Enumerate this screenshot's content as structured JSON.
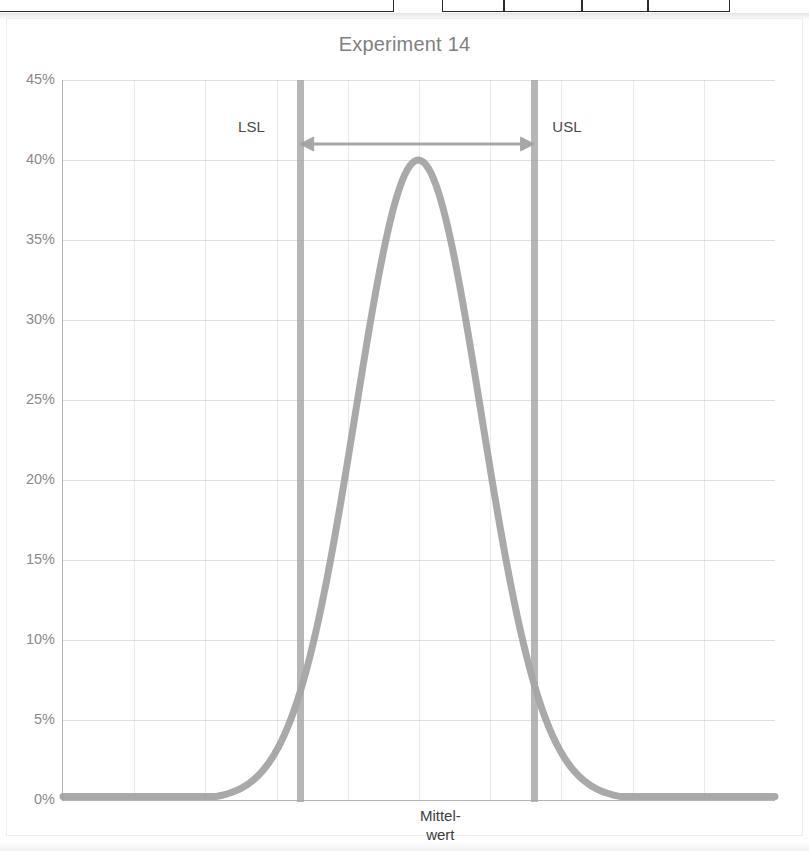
{
  "chart_title": "Experiment 14",
  "top_cut_cells": [
    {
      "left": -6,
      "width": 400
    },
    {
      "left": 442,
      "width": 62
    },
    {
      "left": 504,
      "width": 78
    },
    {
      "left": 582,
      "width": 66
    },
    {
      "left": 648,
      "width": 82
    }
  ],
  "axis": {
    "y_ticks": [
      "45%",
      "40%",
      "35%",
      "30%",
      "25%",
      "20%",
      "15%",
      "10%",
      "5%",
      "0%"
    ],
    "y_values": [
      45,
      40,
      35,
      30,
      25,
      20,
      15,
      10,
      5,
      0
    ],
    "y_min": 0,
    "y_max": 45
  },
  "annotations": {
    "lsl_label": "LSL",
    "usl_label": "USL",
    "mean_label_line1": "Mittel-",
    "mean_label_line2": "wert"
  },
  "colors": {
    "curve": "#9a9a9a",
    "spec_line": "#a6a6a6",
    "arrow": "#9e9e9e",
    "title_text": "#808080",
    "tick_text": "#8a8a8a",
    "annotation_text": "#3d3d3d",
    "gridline": "#c4c4c4",
    "background": "#ffffff"
  },
  "chart_data": {
    "type": "line",
    "title": "Experiment 14",
    "xlabel": "",
    "ylabel": "",
    "ylim": [
      0,
      45
    ],
    "grid": true,
    "legend": "none",
    "series": [
      {
        "name": "Normal distribution (Gauss curve)",
        "peak_value": 40,
        "peak_x_fraction": 0.499,
        "sigma_fraction": 0.088,
        "x": [
          0.0,
          0.05,
          0.1,
          0.15,
          0.2,
          0.25,
          0.3,
          0.33,
          0.36,
          0.39,
          0.42,
          0.45,
          0.47,
          0.5,
          0.53,
          0.55,
          0.58,
          0.61,
          0.64,
          0.67,
          0.7,
          0.75,
          0.8,
          0.85,
          0.9,
          0.95,
          1.0
        ],
        "values": [
          0.2,
          0.3,
          0.6,
          1.5,
          3.6,
          7.6,
          14.1,
          19.4,
          25.3,
          31.2,
          36.0,
          39.1,
          39.9,
          40.0,
          39.4,
          38.0,
          33.9,
          28.2,
          22.0,
          16.1,
          11.0,
          5.0,
          1.9,
          0.8,
          0.4,
          0.25,
          0.2
        ]
      }
    ],
    "spec_limits": {
      "lsl_x_fraction": 0.333,
      "usl_x_fraction": 0.662,
      "lsl_label": "LSL",
      "usl_label": "USL",
      "curve_at_lsl_percent": 13.5,
      "curve_at_usl_percent": 12.0
    },
    "markers": [
      {
        "label": "Mittel-wert",
        "x_fraction": 0.53,
        "note": "mean value label on x-axis"
      }
    ],
    "annotations": [
      {
        "type": "double-arrow",
        "from_x_fraction": 0.333,
        "to_x_fraction": 0.662,
        "y_percent": 41.0,
        "note": "tolerance width between LSL and USL"
      }
    ]
  }
}
